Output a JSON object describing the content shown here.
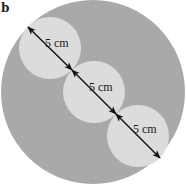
{
  "figure": {
    "panel_label": "b",
    "colors": {
      "background": "#ffffff",
      "outer_circle": "#a9a9a9",
      "inner_circles": "#dcdcdc",
      "arrow": "#111111",
      "text": "#1a1a1a"
    },
    "outer_circle": {
      "cx": 93,
      "cy": 92,
      "r": 92
    },
    "inner_circles": [
      {
        "cx": 50,
        "cy": 48,
        "r": 31,
        "label": "5 cm",
        "label_x": 45,
        "label_y": 47
      },
      {
        "cx": 94,
        "cy": 92,
        "r": 31,
        "label": "5 cm",
        "label_x": 89,
        "label_y": 91
      },
      {
        "cx": 138,
        "cy": 136,
        "r": 31,
        "label": "5 cm",
        "label_x": 133,
        "label_y": 133
      }
    ],
    "dimension_line": {
      "start": [
        28,
        27
      ],
      "end": [
        160,
        158
      ],
      "tangent_points": [
        [
          72,
          70
        ],
        [
          116,
          114
        ]
      ]
    }
  }
}
